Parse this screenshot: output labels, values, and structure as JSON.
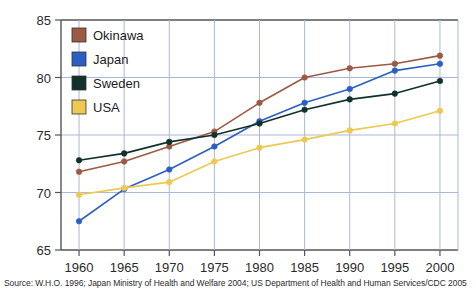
{
  "chart_data": {
    "type": "line",
    "title": "",
    "xlabel": "",
    "ylabel": "",
    "categories": [
      "1960",
      "1965",
      "1970",
      "1975",
      "1980",
      "1985",
      "1990",
      "1995",
      "2000"
    ],
    "x": [
      1960,
      1965,
      1970,
      1975,
      1980,
      1985,
      1990,
      1995,
      2000
    ],
    "xlim": [
      1958,
      2002
    ],
    "ylim": [
      65,
      85
    ],
    "yticks": [
      "65",
      "70",
      "75",
      "80",
      "85"
    ],
    "ytick_values": [
      65,
      70,
      75,
      80,
      85
    ],
    "grid": true,
    "legend_position": "top-left",
    "series": [
      {
        "name": "Okinawa",
        "color": "#9c5a42",
        "values": [
          71.8,
          72.7,
          74.0,
          75.3,
          77.8,
          80.0,
          80.8,
          81.2,
          81.9
        ]
      },
      {
        "name": "Japan",
        "color": "#2b5fc4",
        "values": [
          67.5,
          70.3,
          72.0,
          74.0,
          76.2,
          77.8,
          79.0,
          80.6,
          81.2
        ]
      },
      {
        "name": "Sweden",
        "color": "#12302c",
        "values": [
          72.8,
          73.4,
          74.4,
          75.0,
          76.0,
          77.2,
          78.1,
          78.6,
          79.7
        ]
      },
      {
        "name": "USA",
        "color": "#edc košt"
      }
    ]
  },
  "legend": {
    "items": [
      {
        "label": "Okinawa",
        "color": "#9c5a42"
      },
      {
        "label": "Japan",
        "color": "#2b5fc4"
      },
      {
        "label": "Sweden",
        "color": "#12302c"
      },
      {
        "label": "USA",
        "color": "#edc951"
      }
    ]
  },
  "source": {
    "text": "Source: W.H.O. 1996; Japan Ministry of Health and Welfare 2004; US Department of Health and Human Services/CDC 2005"
  },
  "colors": {
    "okinawa": "#9c5a42",
    "japan": "#2b5fc4",
    "sweden": "#12302c",
    "usa": "#edc951",
    "grid": "#aab8d8",
    "axis": "#555555",
    "background": "#ffffff"
  }
}
